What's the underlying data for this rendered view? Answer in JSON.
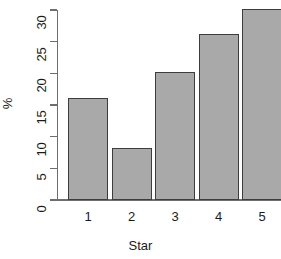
{
  "chart_data": {
    "type": "bar",
    "title": "",
    "subtitle": "",
    "xlabel": "Star",
    "ylabel": "%",
    "categories": [
      "1",
      "2",
      "3",
      "4",
      "5"
    ],
    "values": [
      16.1,
      8.2,
      20.2,
      26.2,
      30.1
    ],
    "series": [
      {
        "name": "%",
        "values": [
          16.1,
          8.2,
          20.2,
          26.2,
          30.1
        ]
      }
    ],
    "ylim": [
      0,
      30
    ],
    "xlim": [
      0,
      5
    ],
    "yticks": [
      0,
      5,
      10,
      15,
      20,
      25,
      30
    ],
    "ytick_labels": [
      "0",
      "5",
      "10",
      "15",
      "20",
      "25",
      "30"
    ],
    "xtick_labels": [
      "1",
      "2",
      "3",
      "4",
      "5"
    ],
    "grid": false,
    "legend": false,
    "legend_position": "none",
    "annotations": [],
    "style": {
      "bar_fill": "#a9a9a9",
      "bar_border": "#3d3d3d",
      "axis_color": "#6e6e6e",
      "text_color": "#1a1a1a",
      "background": "#ffffff",
      "ylabel_rotation": 90,
      "ytick_label_rotation": 90
    }
  }
}
